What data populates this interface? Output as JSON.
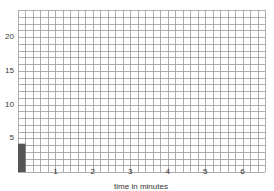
{
  "chart_data": {
    "type": "bar",
    "title": "",
    "xlabel": "time in minutes",
    "ylabel": "",
    "xlim": [
      0,
      6.6
    ],
    "ylim": [
      0,
      24
    ],
    "x_ticks": [
      1,
      2,
      3,
      4,
      5,
      6
    ],
    "y_ticks": [
      5,
      10,
      15,
      20
    ],
    "grid": true,
    "grid_x_step": 0.2,
    "grid_y_step": 1,
    "bars": [
      {
        "x_start": 0,
        "x_end": 0.2,
        "value": 4.2
      }
    ],
    "colors": {
      "bar": "#555555",
      "grid": "#999999",
      "background": "#ffffff"
    }
  },
  "labels": {
    "xlabel": "time in minutes",
    "yticks": [
      "5",
      "10",
      "15",
      "20"
    ],
    "xticks": [
      "1",
      "2",
      "3",
      "4",
      "5",
      "6"
    ]
  }
}
